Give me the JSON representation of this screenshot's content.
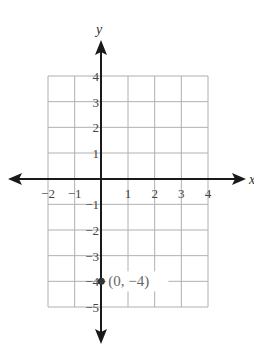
{
  "chart_data": {
    "type": "scatter",
    "title": "",
    "xlabel": "x",
    "ylabel": "y",
    "xlim": [
      -2,
      4
    ],
    "ylim": [
      -5,
      4
    ],
    "grid": true,
    "x_ticks": [
      "−2",
      "−1",
      "1",
      "2",
      "3",
      "4"
    ],
    "y_ticks": [
      "4",
      "3",
      "2",
      "1",
      "−1",
      "−2",
      "−3",
      "−4",
      "−5"
    ],
    "points": [
      {
        "x": 0,
        "y": -4,
        "label": "(0, −4)"
      }
    ]
  },
  "colors": {
    "grid": "#b0b0b0",
    "axis": "#1a1a1a",
    "point": "#333333",
    "tick_text": "#444444"
  }
}
